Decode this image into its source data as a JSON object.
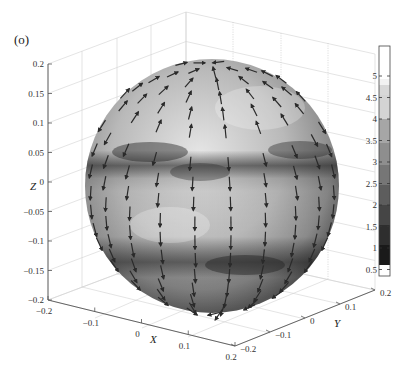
{
  "panel_label": "(o)",
  "chart_data": {
    "type": "3d-surface-quiver",
    "title": "",
    "panel_label": "(o)",
    "xlabel": "X",
    "ylabel": "Y",
    "zlabel": "Z",
    "xlim": [
      -0.2,
      0.2
    ],
    "ylim": [
      -0.2,
      0.2
    ],
    "zlim": [
      -0.2,
      0.2
    ],
    "xticks": [
      "-0.2",
      "-0.1",
      "0",
      "0.1",
      "0.2"
    ],
    "yticks": [
      "-0.2",
      "-0.1",
      "0",
      "0.1",
      "0.2"
    ],
    "zticks": [
      "-0.2",
      "-0.15",
      "-0.1",
      "-0.05",
      "0",
      "0.05",
      "0.1",
      "0.15",
      "0.2"
    ],
    "grid": true,
    "colorbar": {
      "position": "right",
      "range": [
        0.5,
        5.3
      ],
      "ticks": [
        "0.5",
        "1",
        "1.5",
        "2",
        "2.5",
        "3",
        "3.5",
        "4",
        "4.5",
        "5"
      ],
      "colormap": "gray"
    },
    "features": [
      {
        "name": "dark equatorial band (upper)",
        "z_approx": 0.05
      },
      {
        "name": "dark band (lower)",
        "z_approx": -0.15
      }
    ]
  },
  "axes": {
    "z_ticks": [
      "0.2",
      "0.15",
      "0.1",
      "0.05",
      "0",
      "−0.05",
      "−0.1",
      "−0.15",
      "−0.2"
    ],
    "x_ticks": [
      "−0.2",
      "−0.1",
      "0",
      "0.1",
      "0.2"
    ],
    "y_ticks": [
      "−0.2",
      "−0.1",
      "0",
      "0.1",
      "0.2"
    ],
    "x_label": "X",
    "y_label": "Y",
    "z_label": "Z",
    "colorbar_ticks": [
      "5",
      "4.5",
      "4",
      "3.5",
      "3",
      "2.5",
      "2",
      "1.5",
      "1",
      "0.5"
    ]
  }
}
